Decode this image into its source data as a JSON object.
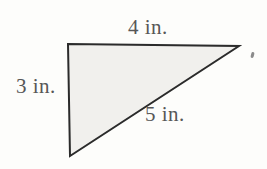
{
  "figure": {
    "type": "right-triangle-diagram",
    "labels": {
      "top": "4 in.",
      "left": "3 in.",
      "hypotenuse": "5 in."
    },
    "sides": {
      "top_length_in": 4,
      "left_length_in": 3,
      "hypotenuse_length_in": 5
    },
    "colors": {
      "fill": "#f1f0ed",
      "stroke": "#2b2b2b",
      "label_text": "#575757",
      "background": "#fdfdfb"
    }
  }
}
